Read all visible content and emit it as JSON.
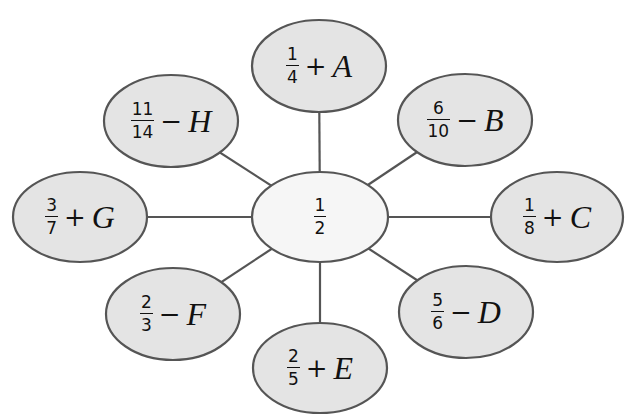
{
  "diagram": {
    "type": "spider-map",
    "colors": {
      "outer_fill": "#e4e4e4",
      "center_fill": "#f6f6f6",
      "stroke": "#555555",
      "text": "#111111"
    },
    "center": {
      "numerator": "1",
      "denominator": "2",
      "cx": 320,
      "cy": 217,
      "rx": 68,
      "ry": 45
    },
    "nodes": [
      {
        "id": "A",
        "numerator": "1",
        "denominator": "4",
        "operator": "+",
        "variable": "A",
        "cx": 319,
        "cy": 66,
        "rx": 67,
        "ry": 46
      },
      {
        "id": "B",
        "numerator": "6",
        "denominator": "10",
        "operator": "−",
        "variable": "B",
        "cx": 465,
        "cy": 120,
        "rx": 67,
        "ry": 46
      },
      {
        "id": "C",
        "numerator": "1",
        "denominator": "8",
        "operator": "+",
        "variable": "C",
        "cx": 557,
        "cy": 217,
        "rx": 66,
        "ry": 45
      },
      {
        "id": "D",
        "numerator": "5",
        "denominator": "6",
        "operator": "−",
        "variable": "D",
        "cx": 466,
        "cy": 312,
        "rx": 67,
        "ry": 46
      },
      {
        "id": "E",
        "numerator": "2",
        "denominator": "5",
        "operator": "+",
        "variable": "E",
        "cx": 320,
        "cy": 368,
        "rx": 67,
        "ry": 45
      },
      {
        "id": "F",
        "numerator": "2",
        "denominator": "3",
        "operator": "−",
        "variable": "F",
        "cx": 173,
        "cy": 314,
        "rx": 67,
        "ry": 46
      },
      {
        "id": "G",
        "numerator": "3",
        "denominator": "7",
        "operator": "+",
        "variable": "G",
        "cx": 80,
        "cy": 217,
        "rx": 67,
        "ry": 45
      },
      {
        "id": "H",
        "numerator": "11",
        "denominator": "14",
        "operator": "−",
        "variable": "H",
        "cx": 171,
        "cy": 121,
        "rx": 67,
        "ry": 46
      }
    ]
  }
}
